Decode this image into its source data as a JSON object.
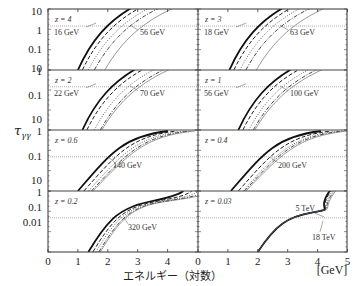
{
  "chart_data": {
    "type": "line",
    "title": "",
    "xlabel": "エネルギー（対数）",
    "xunit": "[GeV]",
    "ylabel": "τγγ",
    "layout": "4 rows × 2 columns of panels, shared log-energy x-axis 0–5 per column",
    "x_ticks": [
      0,
      1,
      2,
      3,
      4
    ],
    "x_ticks_right": [
      0,
      1,
      2,
      3,
      4,
      5
    ],
    "xlim": [
      0,
      5
    ],
    "y_tick_rows": [
      [
        "10",
        "1",
        "0.1",
        "10"
      ],
      [
        "1",
        "0.1",
        "10"
      ],
      [
        "1",
        "0.1",
        "10"
      ],
      [
        "1",
        "0.1",
        "0.01"
      ]
    ],
    "grid": false,
    "series_styles": [
      "solid-thick",
      "dashed",
      "dotted",
      "dash-dot",
      "solid-thin"
    ],
    "panels": [
      {
        "z": "z = 4",
        "row": 0,
        "col": 0,
        "threshold_tau": 1,
        "annotations": [
          "16 GeV",
          "56 GeV"
        ],
        "curve_start_x": [
          1.0,
          1.15,
          1.35,
          1.55,
          1.9
        ],
        "steep": 1.0
      },
      {
        "z": "z = 3",
        "row": 0,
        "col": 1,
        "threshold_tau": 1,
        "annotations": [
          "18 GeV",
          "63 GeV"
        ],
        "curve_start_x": [
          1.05,
          1.2,
          1.4,
          1.6,
          1.95
        ],
        "steep": 1.0
      },
      {
        "z": "z = 2",
        "row": 1,
        "col": 0,
        "threshold_tau": 1,
        "annotations": [
          "22 GeV",
          "70 GeV"
        ],
        "curve_start_x": [
          1.15,
          1.3,
          1.55,
          1.75,
          1.8
        ],
        "steep": 1.0
      },
      {
        "z": "z = 1",
        "row": 1,
        "col": 1,
        "threshold_tau": 1,
        "annotations": [
          "56 GeV",
          "100 GeV"
        ],
        "curve_start_x": [
          1.35,
          1.5,
          1.7,
          1.85,
          1.9
        ],
        "steep": 1.0
      },
      {
        "z": "z = 0.6",
        "row": 2,
        "col": 0,
        "threshold_tau": 0.1,
        "annotations": [
          "140 GeV"
        ],
        "curve_start_x": [
          1.0,
          1.2,
          1.35,
          1.45,
          1.5
        ],
        "steep": 0.8
      },
      {
        "z": "z = 0.4",
        "row": 2,
        "col": 1,
        "threshold_tau": 0.1,
        "annotations": [
          "200 GeV"
        ],
        "curve_start_x": [
          1.1,
          1.35,
          1.5,
          1.55,
          1.6
        ],
        "steep": 0.8
      },
      {
        "z": "z = 0.2",
        "row": 3,
        "col": 0,
        "threshold_tau": 0.1,
        "annotations": [
          "320 GeV"
        ],
        "curve_start_x": [
          1.35,
          1.5,
          1.6,
          1.7,
          1.75
        ],
        "steep": 0.6
      },
      {
        "z": "z = 0.03",
        "row": 3,
        "col": 1,
        "threshold_tau": 0.1,
        "annotations": [
          "5 TeV",
          "18 TeV"
        ],
        "curve_start_x": [
          2.0,
          2.0,
          2.0,
          2.0,
          2.0
        ],
        "steep": 0.5
      }
    ]
  },
  "labels": {
    "xlabel": "エネルギー（対数）",
    "xunit": "[GeV]",
    "ylabel": "τ",
    "ylabel_sub": "γγ"
  }
}
